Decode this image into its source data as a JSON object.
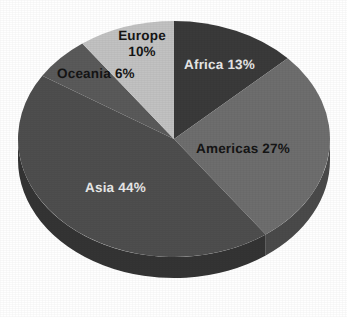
{
  "chart_data": {
    "type": "pie",
    "title": "",
    "subtitle": "",
    "xlabel": "",
    "ylabel": "",
    "legend_position": "none",
    "grid": false,
    "three_d": true,
    "labels_on_slices": true,
    "categories": [
      "Africa",
      "Americas",
      "Asia",
      "Oceania",
      "Europe"
    ],
    "values": [
      13,
      27,
      44,
      6,
      10
    ],
    "unit": "%",
    "slices": [
      {
        "name": "Africa",
        "value": 13,
        "label": "Africa 13%",
        "color": "#3a3a3a",
        "side_color": "#262626",
        "label_color": "#e8e8e8",
        "start_angle": 0,
        "end_angle": 46.8
      },
      {
        "name": "Americas",
        "value": 27,
        "label": "Americas 27%",
        "color": "#6e6e6e",
        "side_color": "#4a4a4a",
        "label_color": "#151515",
        "start_angle": 46.8,
        "end_angle": 144.0
      },
      {
        "name": "Asia",
        "value": 44,
        "label": "Asia 44%",
        "color": "#4e4e4e",
        "side_color": "#343434",
        "label_color": "#e8e8e8",
        "start_angle": 144.0,
        "end_angle": 302.4
      },
      {
        "name": "Oceania",
        "value": 6,
        "label": "Oceania 6%",
        "color": "#5a5a5a",
        "side_color": "#3c3c3c",
        "label_color": "#151515",
        "start_angle": 302.4,
        "end_angle": 324.0
      },
      {
        "name": "Europe",
        "value": 10,
        "label": "Europe 10%",
        "label_line1": "Europe",
        "label_line2": "10%",
        "color": "#c2c2c2",
        "side_color": "#8e8e8e",
        "label_color": "#151515",
        "start_angle": 324.0,
        "end_angle": 360.0
      }
    ],
    "total": 100,
    "background_color": "#ffffff"
  }
}
